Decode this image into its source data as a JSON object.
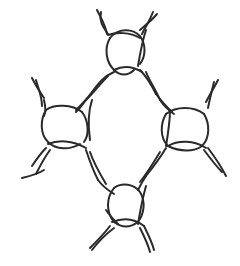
{
  "diagram": {
    "type": "knot-diagram",
    "stroke_color": "#2a2a2a",
    "background": "#ffffff",
    "nodes": [
      {
        "id": "top",
        "cx": 125,
        "cy": 50
      },
      {
        "id": "left",
        "cx": 65,
        "cy": 128
      },
      {
        "id": "right",
        "cx": 185,
        "cy": 128
      },
      {
        "id": "bottom",
        "cx": 125,
        "cy": 205
      }
    ]
  }
}
